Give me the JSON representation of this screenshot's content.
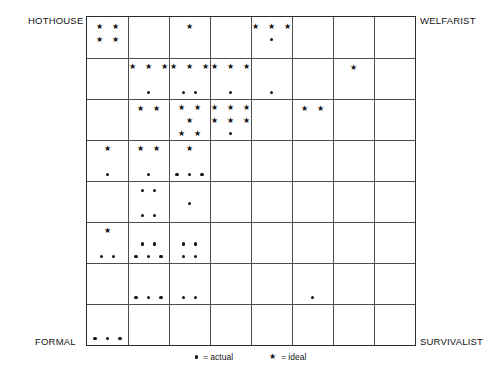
{
  "figure": {
    "type": "grid-scatter-matrix",
    "corner_labels": {
      "top_left": "HOTHOUSE",
      "top_right": "WELFARIST",
      "bottom_left": "FORMAL",
      "bottom_right": "SURVIVALIST"
    },
    "grid": {
      "columns": 8,
      "rows": 8
    },
    "colors": {
      "grid_line": "#4d4d4d",
      "border": "#2b2b2b",
      "marker": "#111111",
      "background": "#ffffff"
    }
  },
  "legend": {
    "items": [
      {
        "icon": "dot-icon",
        "symbol": "●",
        "text": "= actual"
      },
      {
        "icon": "star-icon",
        "symbol": "★",
        "text": "= ideal"
      }
    ]
  },
  "chart_data": {
    "type": "scatter",
    "title": "",
    "xlabel": "",
    "ylabel": "",
    "grid": true,
    "legend_position": "bottom",
    "axes": {
      "x_left_label": "FORMAL",
      "x_right_label": "SURVIVALIST",
      "y_top_label_left": "HOTHOUSE",
      "y_top_label_right": "WELFARIST"
    },
    "series": [
      {
        "name": "actual",
        "symbol": "dot"
      },
      {
        "name": "ideal",
        "symbol": "star"
      }
    ],
    "cells": [
      {
        "row": 1,
        "col": 1,
        "rows": [
          {
            "marks": [
              "star",
              "star"
            ]
          },
          {
            "marks": [
              "star",
              "star"
            ]
          }
        ]
      },
      {
        "row": 1,
        "col": 3,
        "rows": [
          {
            "marks": [
              "star"
            ]
          }
        ]
      },
      {
        "row": 1,
        "col": 5,
        "rows": [
          {
            "marks": [
              "star",
              "star",
              "star"
            ]
          },
          {
            "marks": [
              "dot"
            ]
          }
        ]
      },
      {
        "row": 2,
        "col": 2,
        "rows": [
          {
            "marks": [
              "star",
              "star",
              "star"
            ]
          },
          {
            "marks": []
          },
          {
            "marks": [
              "dot"
            ]
          }
        ]
      },
      {
        "row": 2,
        "col": 3,
        "rows": [
          {
            "marks": [
              "star",
              "star",
              "star"
            ]
          },
          {
            "marks": []
          },
          {
            "marks": [
              "dot",
              "dot"
            ]
          }
        ]
      },
      {
        "row": 2,
        "col": 4,
        "rows": [
          {
            "marks": [
              "star",
              "star",
              "star"
            ]
          },
          {
            "marks": []
          },
          {
            "marks": [
              "dot"
            ]
          }
        ]
      },
      {
        "row": 2,
        "col": 5,
        "rows": [
          {
            "marks": []
          },
          {
            "marks": []
          },
          {
            "marks": [
              "dot"
            ]
          }
        ]
      },
      {
        "row": 2,
        "col": 7,
        "rows": [
          {
            "marks": [
              "star"
            ]
          }
        ]
      },
      {
        "row": 3,
        "col": 2,
        "rows": [
          {
            "marks": [
              "star",
              "star"
            ]
          }
        ]
      },
      {
        "row": 3,
        "col": 3,
        "rows": [
          {
            "marks": [
              "star",
              "star"
            ]
          },
          {
            "marks": [
              "star"
            ]
          },
          {
            "marks": [
              "star",
              "star"
            ]
          }
        ]
      },
      {
        "row": 3,
        "col": 4,
        "rows": [
          {
            "marks": [
              "star",
              "star",
              "star"
            ]
          },
          {
            "marks": [
              "star",
              "star",
              "star"
            ]
          },
          {
            "marks": [
              "dot"
            ]
          }
        ]
      },
      {
        "row": 3,
        "col": 6,
        "rows": [
          {
            "marks": [
              "star",
              "star"
            ]
          }
        ]
      },
      {
        "row": 4,
        "col": 1,
        "rows": [
          {
            "marks": [
              "star"
            ]
          },
          {
            "marks": []
          },
          {
            "marks": [
              "dot"
            ]
          }
        ]
      },
      {
        "row": 4,
        "col": 2,
        "rows": [
          {
            "marks": [
              "star",
              "star"
            ]
          },
          {
            "marks": []
          },
          {
            "marks": [
              "dot"
            ]
          }
        ]
      },
      {
        "row": 4,
        "col": 3,
        "rows": [
          {
            "marks": [
              "star"
            ]
          },
          {
            "marks": []
          },
          {
            "marks": [
              "dot",
              "dot",
              "dot"
            ]
          }
        ]
      },
      {
        "row": 5,
        "col": 2,
        "rows": [
          {
            "marks": [
              "dot",
              "dot"
            ]
          },
          {
            "marks": []
          },
          {
            "marks": [
              "dot",
              "dot"
            ]
          }
        ]
      },
      {
        "row": 5,
        "col": 3,
        "rows": [
          {
            "marks": []
          },
          {
            "marks": [
              "dot"
            ]
          }
        ]
      },
      {
        "row": 6,
        "col": 1,
        "rows": [
          {
            "marks": [
              "star"
            ]
          },
          {
            "marks": []
          },
          {
            "marks": [
              "dot",
              "dot"
            ]
          }
        ]
      },
      {
        "row": 6,
        "col": 2,
        "rows": [
          {
            "marks": []
          },
          {
            "marks": [
              "dot",
              "dot"
            ]
          },
          {
            "marks": [
              "dot",
              "dot",
              "dot"
            ]
          }
        ]
      },
      {
        "row": 6,
        "col": 3,
        "rows": [
          {
            "marks": []
          },
          {
            "marks": [
              "dot",
              "dot"
            ]
          },
          {
            "marks": [
              "dot",
              "dot"
            ]
          }
        ]
      },
      {
        "row": 7,
        "col": 2,
        "rows": [
          {
            "marks": []
          },
          {
            "marks": []
          },
          {
            "marks": [
              "dot",
              "dot",
              "dot"
            ]
          }
        ]
      },
      {
        "row": 7,
        "col": 3,
        "rows": [
          {
            "marks": []
          },
          {
            "marks": []
          },
          {
            "marks": [
              "dot",
              "dot"
            ]
          }
        ]
      },
      {
        "row": 7,
        "col": 6,
        "rows": [
          {
            "marks": []
          },
          {
            "marks": []
          },
          {
            "marks": [
              "dot"
            ]
          }
        ]
      },
      {
        "row": 8,
        "col": 1,
        "rows": [
          {
            "marks": []
          },
          {
            "marks": []
          },
          {
            "marks": [
              "dot",
              "dot",
              "dot"
            ]
          }
        ]
      }
    ]
  }
}
